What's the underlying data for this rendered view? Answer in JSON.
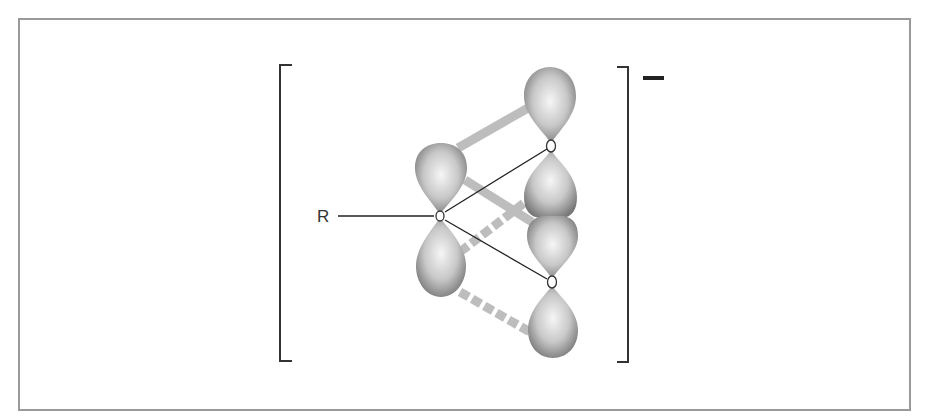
{
  "figure": {
    "type": "molecular orbital diagram",
    "charge": "−",
    "substituent_label": "R",
    "atoms": [
      {
        "id": "C",
        "role": "central carbon",
        "x": 440,
        "y": 216
      },
      {
        "id": "O1",
        "role": "upper oxygen",
        "x": 551,
        "y": 146
      },
      {
        "id": "O2",
        "role": "lower oxygen",
        "x": 552,
        "y": 282
      }
    ],
    "orbitals": [
      {
        "atom": "C",
        "lobe": "upper"
      },
      {
        "atom": "C",
        "lobe": "lower"
      },
      {
        "atom": "O1",
        "lobe": "upper"
      },
      {
        "atom": "O1",
        "lobe": "lower"
      },
      {
        "atom": "O2",
        "lobe": "upper"
      },
      {
        "atom": "O2",
        "lobe": "lower"
      }
    ],
    "overlaps": [
      {
        "from": "C upper lobe",
        "to": "O1 upper lobe",
        "style": "solid"
      },
      {
        "from": "C upper lobe",
        "to": "O2 upper lobe",
        "style": "solid"
      },
      {
        "from": "C lower lobe",
        "to": "O1 lower lobe",
        "style": "dashed"
      },
      {
        "from": "C lower lobe",
        "to": "O2 lower lobe",
        "style": "dashed"
      }
    ],
    "bonds": [
      {
        "from": "R",
        "to": "C"
      },
      {
        "from": "C",
        "to": "O1"
      },
      {
        "from": "C",
        "to": "O2"
      }
    ]
  },
  "colors": {
    "frame": "#9a9a9a",
    "bracket": "#333333",
    "orbital_dark": "#7a7a7a",
    "orbital_light": "#f4f4f4",
    "overlap": "#bdbdbd",
    "bond": "#222222"
  }
}
